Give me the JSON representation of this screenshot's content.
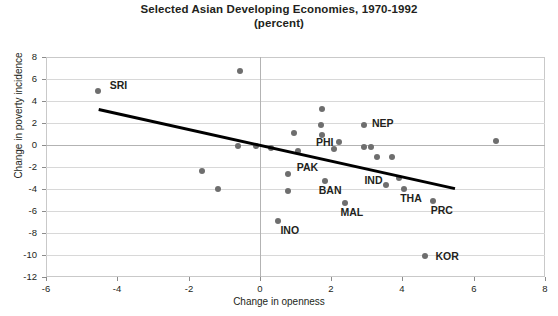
{
  "title": {
    "line1": "Selected Asian Developing Economies, 1970-1992",
    "line2": "(percent)"
  },
  "chart_data": {
    "type": "scatter",
    "title": "Selected Asian Developing Economies, 1970-1992 (percent)",
    "subtitle": "(percent)",
    "xlabel": "Change in openness",
    "ylabel": "Change in poverty incidence",
    "xlim": [
      -6,
      8
    ],
    "ylim": [
      -12,
      8
    ],
    "xticks": [
      "-6",
      "-4",
      "-2",
      "0",
      "2",
      "4",
      "6",
      "8"
    ],
    "yticks": [
      "8",
      "6",
      "4",
      "2",
      "0",
      "-2",
      "-4",
      "-6",
      "-8",
      "-10",
      "-12"
    ],
    "grid": true,
    "legend": "none",
    "trendline": {
      "type": "linear",
      "x_start": -4.5,
      "y_start": 3.4,
      "x_end": 5.5,
      "y_end": -3.8
    },
    "points": [
      {
        "label": "SRI",
        "x": -4.55,
        "y": 4.9,
        "label_dx": 12,
        "label_dy": -12
      },
      {
        "label": "",
        "x": -0.55,
        "y": 6.7
      },
      {
        "label": "",
        "x": -1.62,
        "y": -2.4
      },
      {
        "label": "",
        "x": -1.18,
        "y": -4.0
      },
      {
        "label": "",
        "x": -0.62,
        "y": -0.1
      },
      {
        "label": "",
        "x": -0.1,
        "y": -0.1
      },
      {
        "label": "",
        "x": 0.3,
        "y": -0.3
      },
      {
        "label": "",
        "x": 0.95,
        "y": 1.1
      },
      {
        "label": "",
        "x": 1.08,
        "y": -0.5
      },
      {
        "label": "PAK",
        "x": 0.78,
        "y": -2.6,
        "label_dx": 9,
        "label_dy": -13
      },
      {
        "label": "",
        "x": 0.8,
        "y": -4.2
      },
      {
        "label": "INO",
        "x": 0.52,
        "y": -6.9,
        "label_dx": 2,
        "label_dy": 3
      },
      {
        "label": "",
        "x": 1.75,
        "y": 3.3
      },
      {
        "label": "",
        "x": 1.72,
        "y": 1.8
      },
      {
        "label": "",
        "x": 1.75,
        "y": 0.9
      },
      {
        "label": "PHI",
        "x": 2.08,
        "y": -0.4,
        "label_dx": -18,
        "label_dy": -13
      },
      {
        "label": "BAN",
        "x": 1.82,
        "y": -3.3,
        "label_dx": -6,
        "label_dy": 3
      },
      {
        "label": "MAL",
        "x": 2.4,
        "y": -5.3,
        "label_dx": -5,
        "label_dy": 3
      },
      {
        "label": "",
        "x": 2.22,
        "y": 0.3
      },
      {
        "label": "NEP",
        "x": 2.92,
        "y": 1.8,
        "label_dx": 8,
        "label_dy": -8
      },
      {
        "label": "",
        "x": 2.92,
        "y": -0.2
      },
      {
        "label": "",
        "x": 3.12,
        "y": -0.2
      },
      {
        "label": "",
        "x": 3.3,
        "y": -1.1
      },
      {
        "label": "",
        "x": 3.72,
        "y": -1.1
      },
      {
        "label": "IND",
        "x": 3.55,
        "y": -3.6,
        "label_dx": -22,
        "label_dy": -11
      },
      {
        "label": "",
        "x": 3.9,
        "y": -3.0
      },
      {
        "label": "THA",
        "x": 4.05,
        "y": -4.0,
        "label_dx": -4,
        "label_dy": 3
      },
      {
        "label": "PRC",
        "x": 4.85,
        "y": -5.1,
        "label_dx": -2,
        "label_dy": 3
      },
      {
        "label": "",
        "x": 6.62,
        "y": 0.4
      },
      {
        "label": "KOR",
        "x": 4.62,
        "y": -10.1,
        "label_dx": 11,
        "label_dy": -6
      }
    ]
  },
  "colors": {
    "dot": "#6e6e6e",
    "trendline": "#000000",
    "grid": "#d8d8d8",
    "axis": "#b3b3b3",
    "text": "#231f20"
  }
}
